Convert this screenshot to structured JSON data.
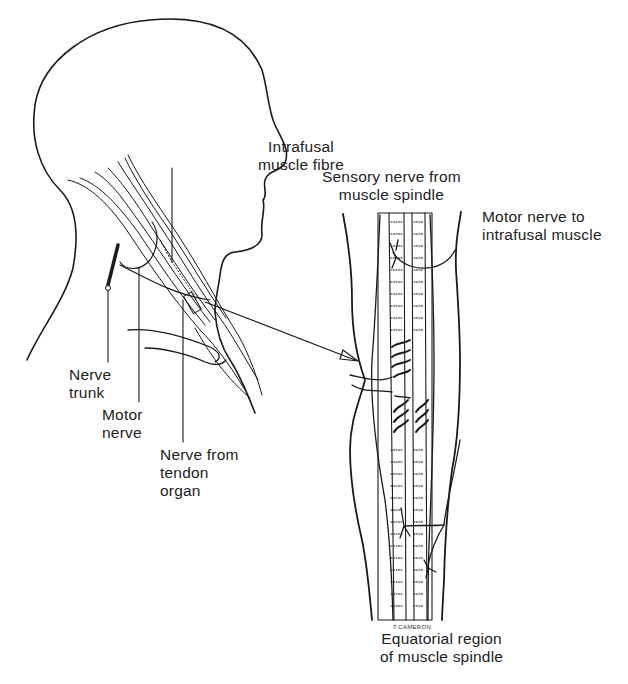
{
  "figure": {
    "artist_signature": "T.CAMERON."
  },
  "labels": {
    "intrafusal_fibre": "Intrafusal\nmuscle fibre",
    "sensory_nerve": "Sensory nerve from\nmuscle spindle",
    "motor_nerve_intrafusal": "Motor nerve to\nintrafusal muscle",
    "nerve_trunk": "Nerve\ntrunk",
    "motor_nerve": "Motor\nnerve",
    "nerve_tendon": "Nerve from\ntendon\norgan",
    "equatorial_region": "Equatorial region\nof muscle spindle"
  },
  "colors": {
    "line": "#1a1a1a",
    "background": "#ffffff",
    "text": "#222222"
  }
}
